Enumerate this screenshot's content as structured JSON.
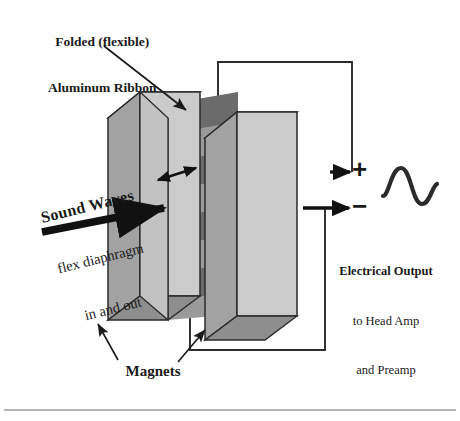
{
  "figure": {
    "background_color": "#ffffff",
    "width": 460,
    "height": 421
  },
  "labels": {
    "ribbon": {
      "line1": "Folded (flexible)",
      "line2": "Aluminum Ribbon"
    },
    "sound_waves": {
      "line1": "Sound Waves",
      "line2": "flex diaphragm",
      "line3": "in and out"
    },
    "electrical_output": {
      "line1": "Electrical Output",
      "line2": "to Head Amp",
      "line3": "and Preamp"
    },
    "magnets": "Magnets"
  },
  "terminals": {
    "positive": "+",
    "negative": "−"
  },
  "colors": {
    "magnet_front": "#cfcfcf",
    "magnet_side": "#9a9a9a",
    "magnet_top": "#d9d9d9",
    "ribbon_dark": "#6e6e6e",
    "ribbon_mid": "#8f8f8f",
    "outline": "#2b2b2b",
    "wire": "#2b2b2b",
    "arrow": "#111111",
    "rule": "#9b9b9b",
    "text": "#1a1a1a"
  },
  "elements": {
    "left_magnet": "left magnet slab",
    "right_magnet": "right magnet slab",
    "ribbon": "corrugated aluminum ribbon diaphragm",
    "motion_arrow": "double-headed ribbon motion arrow",
    "sound_arrow": "thick sound wave arrow",
    "wire_top": "top output wire to positive terminal",
    "wire_bottom": "bottom output wire to negative terminal",
    "waveform": "output sine waveform",
    "bottom_rule": "horizontal divider rule"
  }
}
